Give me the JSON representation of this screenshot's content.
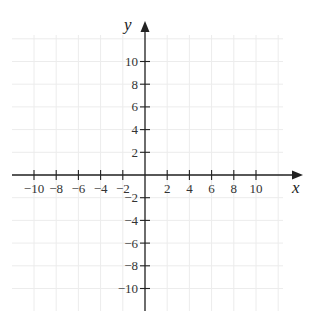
{
  "diagram": {
    "type": "coordinate-plane",
    "x_axis": {
      "label": "x",
      "min": -10,
      "max": 10,
      "tick_step": 2,
      "tick_labels": [
        "−10",
        "−8",
        "−6",
        "−4",
        "−2",
        "2",
        "4",
        "6",
        "8",
        "10"
      ],
      "tick_values": [
        -10,
        -8,
        -6,
        -4,
        -2,
        2,
        4,
        6,
        8,
        10
      ]
    },
    "y_axis": {
      "label": "y",
      "min": -10,
      "max": 10,
      "tick_step": 2,
      "tick_labels": [
        "10",
        "8",
        "6",
        "4",
        "2",
        "−2",
        "−4",
        "−6",
        "−8",
        "−10"
      ],
      "tick_values": [
        10,
        8,
        6,
        4,
        2,
        -2,
        -4,
        -6,
        -8,
        -10
      ]
    },
    "grid": {
      "visible": true,
      "color": "#ececec",
      "step": 2
    },
    "colors": {
      "axis": "#222222",
      "text": "#333333",
      "background": "#ffffff"
    }
  }
}
